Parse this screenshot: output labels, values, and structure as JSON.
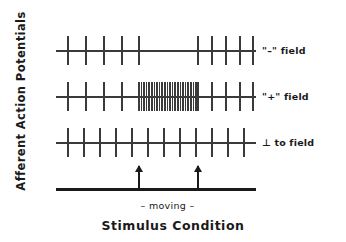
{
  "axes": {
    "ylabel": "Afferent Action Potentials",
    "xlabel": "Stimulus Condition"
  },
  "stimulus": {
    "moving_label": "– moving –",
    "bar_color": "#1a1a1a",
    "arrow_marks": [
      {
        "name": "moving-onset",
        "x_pct": 41.0
      },
      {
        "name": "moving-offset",
        "x_pct": 70.5
      }
    ]
  },
  "chart_data": {
    "type": "raster",
    "title": "",
    "xlabel": "Stimulus Condition",
    "ylabel": "Afferent Action Potentials",
    "xlim": [
      0,
      100
    ],
    "grid": false,
    "legend": "right-row-labels",
    "annotations": [
      "– moving –"
    ],
    "event_window": {
      "start_pct": 41.0,
      "end_pct": 70.5,
      "label": "moving"
    },
    "series": [
      {
        "name": "\"–\" field",
        "row": 1,
        "description": "firing suppressed during moving stimulus",
        "spike_times_pct": [
          5.5,
          14.5,
          23.5,
          32.5,
          41.0,
          70.5,
          77.5,
          84.5,
          91.5,
          98.0
        ],
        "spike_count": 10
      },
      {
        "name": "\"+\" field",
        "row": 2,
        "description": "high-frequency burst during moving stimulus",
        "spike_times_pct": [
          5.5,
          14.5,
          23.5,
          32.5,
          41.0,
          42.3,
          43.6,
          44.9,
          46.2,
          47.5,
          48.8,
          50.1,
          51.4,
          52.7,
          54.0,
          55.3,
          56.6,
          57.9,
          59.2,
          60.5,
          61.8,
          63.1,
          64.4,
          65.7,
          67.0,
          68.3,
          69.6,
          70.5,
          77.5,
          84.5,
          91.5,
          98.0
        ],
        "spike_count": 32
      },
      {
        "name": "⊥ to field",
        "row": 3,
        "description": "regular firing unchanged by moving stimulus",
        "spike_times_pct": [
          5.5,
          13.5,
          21.5,
          29.5,
          37.5,
          45.5,
          53.5,
          61.5,
          69.5,
          77.5,
          85.5,
          93.5
        ],
        "spike_count": 12
      }
    ]
  }
}
